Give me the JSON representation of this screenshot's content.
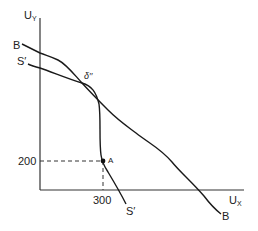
{
  "diagram": {
    "axes": {
      "y_label_main": "U",
      "y_label_sub": "Y",
      "x_label_main": "U",
      "x_label_sub": "X"
    },
    "curves": {
      "B": {
        "label_top": "B",
        "label_bottom": "B"
      },
      "S_prime": {
        "label_top": "S′",
        "label_bottom": "S′"
      }
    },
    "points": {
      "intersection": {
        "label": "δ′′"
      },
      "A": {
        "label": "A",
        "x_value": "300",
        "y_value": "200"
      }
    },
    "tick_labels": {
      "x": "300",
      "y": "200"
    },
    "colors": {
      "line": "#1a1a1a",
      "axis": "#333333",
      "background": "#ffffff"
    }
  }
}
